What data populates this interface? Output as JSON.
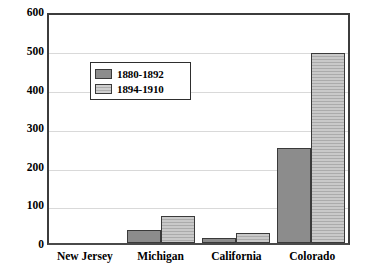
{
  "chart_data": {
    "type": "bar",
    "title": "",
    "xlabel": "",
    "ylabel": "",
    "ylim": [
      0,
      600
    ],
    "yticks": [
      0,
      100,
      200,
      300,
      400,
      500,
      600
    ],
    "grid": true,
    "legend_position": "upper-left-inside",
    "categories": [
      "New Jersey",
      "Michigan",
      "California",
      "Colorado"
    ],
    "series": [
      {
        "name": "1880-1892",
        "values": [
          0,
          33,
          13,
          250
        ],
        "color": "#8c8c8c"
      },
      {
        "name": "1894-1910",
        "values": [
          0,
          70,
          27,
          500
        ],
        "color": "#c9c9c9"
      }
    ]
  },
  "axis": {
    "y_tick_labels": [
      "600",
      "500",
      "400",
      "300",
      "200",
      "100",
      "0"
    ]
  },
  "legend": {
    "items": [
      {
        "label": "1880-1892",
        "swatch": "dark-solid-swatch"
      },
      {
        "label": "1894-1910",
        "swatch": "light-striped-swatch"
      }
    ]
  }
}
